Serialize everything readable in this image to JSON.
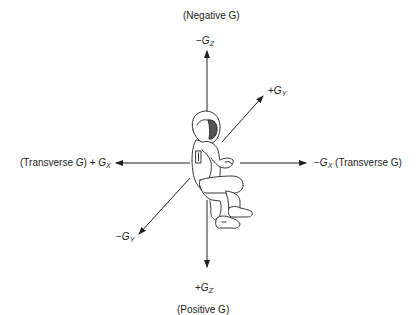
{
  "diagram": {
    "type": "acceleration-axes",
    "labels": {
      "top_caption": "(Negative G)",
      "bottom_caption": "(Positive G)",
      "neg_gz": {
        "sign": "−",
        "letter": "G",
        "sub": "Z"
      },
      "pos_gz": {
        "sign": "+",
        "letter": "G",
        "sub": "Z"
      },
      "pos_gy": {
        "sign": "+",
        "letter": "G",
        "sub": "Y"
      },
      "neg_gy": {
        "sign": "−",
        "letter": "G",
        "sub": "Y"
      },
      "pos_gx": {
        "prefix": "(Transverse ",
        "prefix_g": "G",
        "prefix_close": ") + ",
        "letter": "G",
        "sub": "X"
      },
      "neg_gx": {
        "sign": "−",
        "letter": "G",
        "sub": "X",
        "suffix": " (Transverse G)"
      }
    },
    "colors": {
      "line": "#222222",
      "background": "#ffffff"
    }
  }
}
